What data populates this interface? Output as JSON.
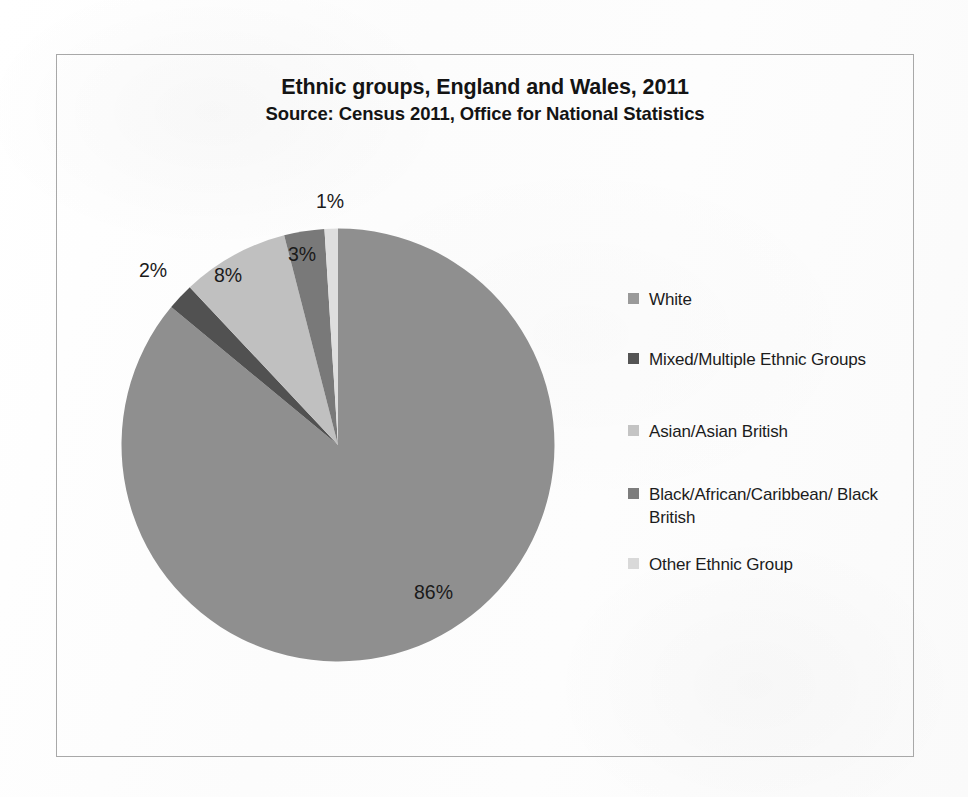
{
  "document": {
    "background_color": "#fefefe",
    "frame_border_color": "#a8a8a8"
  },
  "chart_data": {
    "type": "pie",
    "title": "Ethnic groups, England and Wales, 2011",
    "subtitle": "Source: Census 2011, Office for National Statistics",
    "xlabel": "",
    "ylabel": "",
    "legend_position": "right",
    "grid": false,
    "start_angle_deg": 0,
    "direction": "clockwise",
    "categories": [
      "White",
      "Mixed/Multiple Ethnic Groups",
      "Asian/Asian British",
      "Black/African/Caribbean/ Black British",
      "Other Ethnic Group"
    ],
    "values": [
      86,
      2,
      8,
      3,
      1
    ],
    "value_labels": [
      "86%",
      "2%",
      "8%",
      "3%",
      "1%"
    ],
    "slice_colors": [
      "#8f8f8f",
      "#515151",
      "#c0c0c0",
      "#797979",
      "#dedede"
    ]
  },
  "title": {
    "line1": "Ethnic groups, England and Wales, 2011",
    "line2": "Source: Census 2011, Office for National Statistics"
  },
  "pie": {
    "labels": {
      "white": "86%",
      "mixed": "2%",
      "asian": "8%",
      "black": "3%",
      "other": "1%"
    }
  },
  "legend": {
    "items": [
      {
        "label": "White",
        "color": "#9a9a9a"
      },
      {
        "label": "Mixed/Multiple Ethnic Groups",
        "color": "#545454"
      },
      {
        "label": "Asian/Asian British",
        "color": "#c4c4c4"
      },
      {
        "label": "Black/African/Caribbean/ Black British",
        "color": "#7d7d7d"
      },
      {
        "label": "Other Ethnic Group",
        "color": "#d9d9d9"
      }
    ]
  }
}
